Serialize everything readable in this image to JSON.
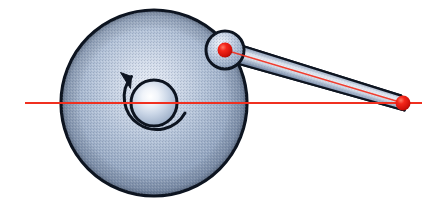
{
  "figure": {
    "kind": "mechanical-diagram",
    "name": "slider-crank mechanism",
    "canvas": {
      "width": 429,
      "height": 203,
      "background": "#ffffff"
    }
  },
  "colors": {
    "metal_light": "#f2f5fa",
    "metal_mid": "#9fb0c8",
    "metal_edge": "#7e90ad",
    "metal_dark": "#60728f",
    "outline": "#0d1420",
    "axis_red": "#f03020",
    "pin_red": "#ee1c14",
    "pin_red_dark": "#9e0d08",
    "rod_light": "#e6ebf2",
    "rod_shadow": "#5b6b86"
  },
  "parts": {
    "flywheel": {
      "label": "flywheel-disc",
      "cx": 154,
      "cy": 103,
      "r": 93,
      "highlight_x": 148,
      "highlight_y": 86,
      "stroke_width": 3.2
    },
    "hub": {
      "label": "center-hub",
      "cx": 154,
      "cy": 103,
      "r": 23,
      "highlight_x": 150,
      "highlight_y": 96,
      "stroke_width": 3.0
    },
    "rotation_arrow": {
      "label": "rotation-direction-arrow",
      "cx": 154,
      "cy": 103,
      "r": 32,
      "direction": "counter-clockwise",
      "stroke_width": 3.0,
      "path": "M 184 114 A 32 32 0 1 1 130 77",
      "head": "M 130 77 L 121 73 L 129 86 Z"
    },
    "crank_pin_boss": {
      "label": "crank-pin-boss",
      "cx": 225,
      "cy": 50,
      "r": 19,
      "highlight_x": 219,
      "highlight_y": 43,
      "stroke_width": 3.0
    },
    "crank_pin": {
      "label": "crank-pin-joint",
      "cx": 225,
      "cy": 50,
      "r": 7.5
    },
    "connecting_rod": {
      "label": "connecting-rod",
      "from_x": 225,
      "from_y": 50,
      "to_x": 403,
      "to_y": 103,
      "half_width_start": 11,
      "half_width_end": 7.5,
      "stroke_width": 2.2,
      "outline_path": "M 222.0 39.5 L 401.2 95.6 L 404.6 110.5 L 228.4 61.0 Z"
    },
    "slider_pin": {
      "label": "slider-pin-joint",
      "cx": 403,
      "cy": 103,
      "r": 7.5
    },
    "centerline": {
      "label": "horizontal-axis-centerline",
      "x1": 25,
      "y1": 103,
      "x2": 422,
      "y2": 103,
      "stroke_width": 1.8
    },
    "rod_centerline": {
      "label": "rod-axis-line",
      "x1": 225,
      "y1": 50,
      "x2": 403,
      "y2": 103,
      "stroke_width": 1.6
    }
  },
  "annotations": {
    "title": "",
    "labels": []
  }
}
